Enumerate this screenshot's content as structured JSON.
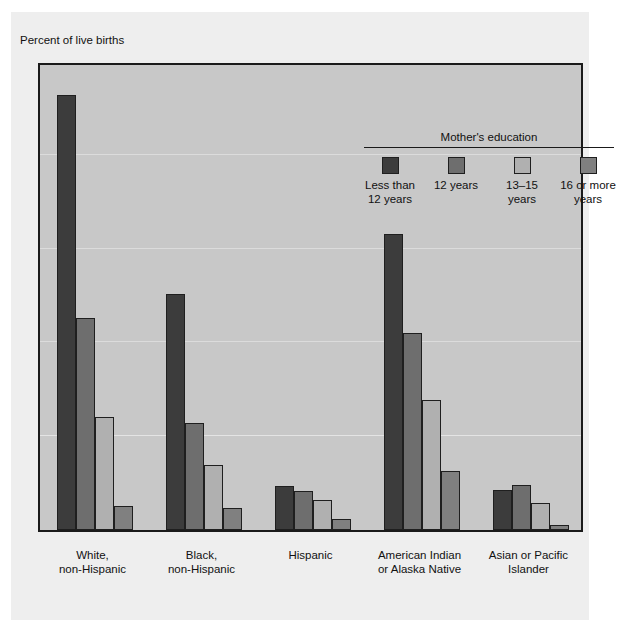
{
  "figure": {
    "axis_caption": "Percent of live births",
    "background_color": "#eeeeee",
    "plot_background_color": "#c8c8c8",
    "frame_color": "#1a1a1a"
  },
  "legend": {
    "title": "Mother's education",
    "items": [
      {
        "label": "Less than\n12 years",
        "color": "#3c3c3c"
      },
      {
        "label": "12 years",
        "color": "#6e6e6e"
      },
      {
        "label": "13–15 years",
        "color": "#b0b0b0"
      },
      {
        "label": "16 or more\nyears",
        "color": "#808080"
      }
    ]
  },
  "chart_data": {
    "type": "bar",
    "title": "",
    "xlabel": "",
    "ylabel": "Percent of live births",
    "ylim": [
      0,
      50
    ],
    "yticks": [
      0,
      10,
      20,
      30,
      40,
      50
    ],
    "ytick_labels": [
      "0",
      "10",
      "20",
      "30",
      "40",
      "50"
    ],
    "grid": true,
    "legend_position": "top-right-inside",
    "categories": [
      "White,\nnon-Hispanic",
      "Black,\nnon-Hispanic",
      "Hispanic",
      "American Indian\nor Alaska Native",
      "Asian or Pacific\nIslander"
    ],
    "series": [
      {
        "name": "Less than 12 years",
        "color": "#3c3c3c",
        "values": [
          46.4,
          25.2,
          4.7,
          31.6,
          4.3
        ]
      },
      {
        "name": "12 years",
        "color": "#6e6e6e",
        "values": [
          22.6,
          11.4,
          4.2,
          21.0,
          4.8
        ]
      },
      {
        "name": "13–15 years",
        "color": "#b0b0b0",
        "values": [
          12.0,
          6.9,
          3.2,
          13.9,
          2.9
        ]
      },
      {
        "name": "16 or more years",
        "color": "#808080",
        "values": [
          2.6,
          2.4,
          1.2,
          6.3,
          0.5
        ]
      }
    ]
  }
}
